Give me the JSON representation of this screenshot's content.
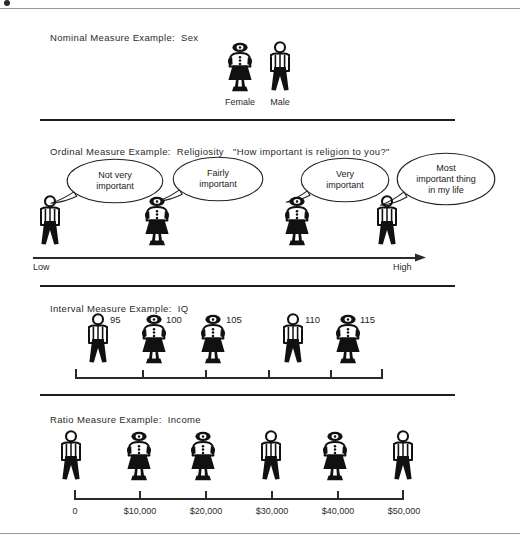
{
  "sections": [
    {
      "id": "nominal",
      "title_prefix": "Nominal Measure Example:",
      "title_value": "Sex",
      "figures": [
        {
          "gender": "female",
          "label": "Female"
        },
        {
          "gender": "male",
          "label": "Male"
        }
      ]
    },
    {
      "id": "ordinal",
      "title_prefix": "Ordinal Measure Example:",
      "title_value": "Religiosity",
      "title_question": "\"How important is religion to you?\"",
      "figures": [
        {
          "gender": "male",
          "bubble": "Not very\nimportant"
        },
        {
          "gender": "female",
          "bubble": "Fairly\nimportant"
        },
        {
          "gender": "female",
          "bubble": "Very\nimportant"
        },
        {
          "gender": "male",
          "bubble": "Most\nimportant  thing\nin my life"
        }
      ],
      "axis_low": "Low",
      "axis_high": "High"
    },
    {
      "id": "interval",
      "title_prefix": "Interval Measure Example:",
      "title_value": "IQ",
      "figures": [
        {
          "gender": "male",
          "value": "95"
        },
        {
          "gender": "female",
          "value": "100"
        },
        {
          "gender": "female",
          "value": "105"
        },
        {
          "gender": "male",
          "value": "110"
        },
        {
          "gender": "female",
          "value": "115"
        }
      ]
    },
    {
      "id": "ratio",
      "title_prefix": "Ratio Measure Example:",
      "title_value": "Income",
      "figures": [
        {
          "gender": "male",
          "value": "0"
        },
        {
          "gender": "female",
          "value": "$10,000"
        },
        {
          "gender": "female",
          "value": "$20,000"
        },
        {
          "gender": "male",
          "value": "$30,000"
        },
        {
          "gender": "female",
          "value": "$40,000"
        },
        {
          "gender": "male",
          "value": "$50,000"
        }
      ]
    }
  ],
  "colors": {
    "ink": "#1a1a1a",
    "rule": "#9a9a9a",
    "divider": "#1d1d1d"
  }
}
